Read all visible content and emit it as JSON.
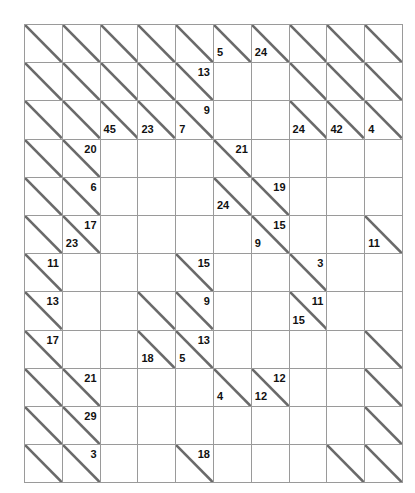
{
  "puzzle": {
    "type": "kakuro",
    "title": "Kakuro Grid",
    "columns": 10,
    "rows": 12,
    "colors": {
      "clue_cell_fill": "#c9c9c9",
      "entry_cell_fill": "#ffffff",
      "grid_line": "#9a9a9a",
      "border": "#7d7d7d",
      "clue_text": "#111111",
      "diagonal_line": "#6a6a6a"
    },
    "cells": [
      [
        {
          "kind": "clue"
        },
        {
          "kind": "clue"
        },
        {
          "kind": "clue"
        },
        {
          "kind": "clue"
        },
        {
          "kind": "clue"
        },
        {
          "kind": "clue",
          "down": "5"
        },
        {
          "kind": "clue",
          "down": "24"
        },
        {
          "kind": "clue"
        },
        {
          "kind": "clue"
        },
        {
          "kind": "clue"
        }
      ],
      [
        {
          "kind": "clue"
        },
        {
          "kind": "clue"
        },
        {
          "kind": "clue"
        },
        {
          "kind": "clue"
        },
        {
          "kind": "clue",
          "across": "13"
        },
        {
          "kind": "entry"
        },
        {
          "kind": "entry"
        },
        {
          "kind": "clue"
        },
        {
          "kind": "clue"
        },
        {
          "kind": "clue"
        }
      ],
      [
        {
          "kind": "clue"
        },
        {
          "kind": "clue"
        },
        {
          "kind": "clue",
          "down": "45"
        },
        {
          "kind": "clue",
          "down": "23"
        },
        {
          "kind": "clue",
          "down": "7",
          "across": "9"
        },
        {
          "kind": "entry"
        },
        {
          "kind": "entry"
        },
        {
          "kind": "clue",
          "down": "24"
        },
        {
          "kind": "clue",
          "down": "42"
        },
        {
          "kind": "clue",
          "down": "4"
        }
      ],
      [
        {
          "kind": "clue"
        },
        {
          "kind": "clue",
          "across": "20"
        },
        {
          "kind": "entry"
        },
        {
          "kind": "entry"
        },
        {
          "kind": "entry"
        },
        {
          "kind": "clue",
          "across": "21"
        },
        {
          "kind": "entry"
        },
        {
          "kind": "entry"
        },
        {
          "kind": "entry"
        },
        {
          "kind": "entry"
        }
      ],
      [
        {
          "kind": "clue"
        },
        {
          "kind": "clue",
          "across": "6"
        },
        {
          "kind": "entry"
        },
        {
          "kind": "entry"
        },
        {
          "kind": "entry"
        },
        {
          "kind": "clue",
          "down": "24"
        },
        {
          "kind": "clue",
          "across": "19"
        },
        {
          "kind": "entry"
        },
        {
          "kind": "entry"
        },
        {
          "kind": "entry"
        }
      ],
      [
        {
          "kind": "clue"
        },
        {
          "kind": "clue",
          "down": "23",
          "across": "17"
        },
        {
          "kind": "entry"
        },
        {
          "kind": "entry"
        },
        {
          "kind": "entry"
        },
        {
          "kind": "entry"
        },
        {
          "kind": "clue",
          "down": "9",
          "across": "15"
        },
        {
          "kind": "entry"
        },
        {
          "kind": "entry"
        },
        {
          "kind": "clue",
          "down": "11"
        }
      ],
      [
        {
          "kind": "clue",
          "across": "11"
        },
        {
          "kind": "entry"
        },
        {
          "kind": "entry"
        },
        {
          "kind": "entry"
        },
        {
          "kind": "clue",
          "across": "15"
        },
        {
          "kind": "entry"
        },
        {
          "kind": "entry"
        },
        {
          "kind": "clue",
          "across": "3"
        },
        {
          "kind": "entry"
        },
        {
          "kind": "entry"
        }
      ],
      [
        {
          "kind": "clue",
          "across": "13"
        },
        {
          "kind": "entry"
        },
        {
          "kind": "entry"
        },
        {
          "kind": "clue"
        },
        {
          "kind": "clue",
          "across": "9"
        },
        {
          "kind": "entry"
        },
        {
          "kind": "entry"
        },
        {
          "kind": "clue",
          "down": "15",
          "across": "11"
        },
        {
          "kind": "entry"
        },
        {
          "kind": "entry"
        }
      ],
      [
        {
          "kind": "clue",
          "across": "17"
        },
        {
          "kind": "entry"
        },
        {
          "kind": "entry"
        },
        {
          "kind": "clue",
          "down": "18"
        },
        {
          "kind": "clue",
          "down": "5",
          "across": "13"
        },
        {
          "kind": "entry"
        },
        {
          "kind": "entry"
        },
        {
          "kind": "entry"
        },
        {
          "kind": "entry"
        },
        {
          "kind": "clue"
        }
      ],
      [
        {
          "kind": "clue"
        },
        {
          "kind": "clue",
          "across": "21"
        },
        {
          "kind": "entry"
        },
        {
          "kind": "entry"
        },
        {
          "kind": "entry"
        },
        {
          "kind": "clue",
          "down": "4"
        },
        {
          "kind": "clue",
          "down": "12",
          "across": "12"
        },
        {
          "kind": "entry"
        },
        {
          "kind": "entry"
        },
        {
          "kind": "clue"
        }
      ],
      [
        {
          "kind": "clue"
        },
        {
          "kind": "clue",
          "across": "29"
        },
        {
          "kind": "entry"
        },
        {
          "kind": "entry"
        },
        {
          "kind": "entry"
        },
        {
          "kind": "entry"
        },
        {
          "kind": "entry"
        },
        {
          "kind": "entry"
        },
        {
          "kind": "entry"
        },
        {
          "kind": "clue"
        }
      ],
      [
        {
          "kind": "clue"
        },
        {
          "kind": "clue",
          "across": "3"
        },
        {
          "kind": "entry"
        },
        {
          "kind": "entry"
        },
        {
          "kind": "clue",
          "across": "18"
        },
        {
          "kind": "entry"
        },
        {
          "kind": "entry"
        },
        {
          "kind": "entry"
        },
        {
          "kind": "clue"
        },
        {
          "kind": "clue"
        }
      ]
    ]
  }
}
